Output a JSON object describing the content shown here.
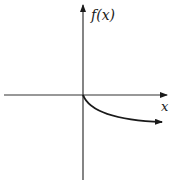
{
  "figure": {
    "y_axis_label": "f(x)",
    "x_axis_label": "x",
    "colors": {
      "axis": "#333333",
      "curve": "#1a1a1a",
      "background": "#ffffff"
    }
  }
}
